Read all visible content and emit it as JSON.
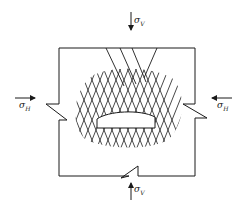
{
  "diagram": {
    "type": "stress-around-cavity",
    "colors": {
      "stroke": "#1a1a1a",
      "background": "#ffffff"
    },
    "labels": {
      "sigma_v_top": {
        "symbol": "σ",
        "subscript": "V"
      },
      "sigma_v_bottom": {
        "symbol": "σ",
        "subscript": "V"
      },
      "sigma_h_left": {
        "symbol": "σ",
        "subscript": "H"
      },
      "sigma_h_right": {
        "symbol": "σ",
        "subscript": "H"
      }
    },
    "arrows": [
      {
        "id": "top",
        "direction": "down"
      },
      {
        "id": "bottom",
        "direction": "up"
      },
      {
        "id": "left",
        "direction": "right"
      },
      {
        "id": "right",
        "direction": "left"
      }
    ],
    "elements": {
      "rock_block": "rectangular rock mass with crack notches",
      "cavity": "excavation with domed roof",
      "fracture_zone": "cross-hatched fractured zone around cavity",
      "shear_fans": "inclined fractures from top surface"
    }
  }
}
